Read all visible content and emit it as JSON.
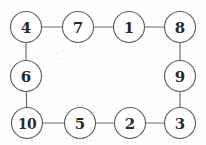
{
  "figure": {
    "kind": "graph-diagram",
    "background_color": "#fefefe",
    "node_fill": "#ffffff",
    "node_stroke": "#5f5f5f",
    "edge_stroke": "#6b6b6b",
    "label_color": "#2a2a2a",
    "node_radius": 15.5,
    "width": 206,
    "height": 145
  },
  "chart_data": {
    "type": "graph",
    "title": "",
    "xlabel": "",
    "ylabel": "",
    "directed": false,
    "node_count": 10,
    "edge_count": 10,
    "nodes": [
      {
        "id": "4",
        "label": "4",
        "x": 26,
        "y": 27,
        "position": "top-left"
      },
      {
        "id": "7",
        "label": "7",
        "x": 78,
        "y": 27,
        "position": "top"
      },
      {
        "id": "1",
        "label": "1",
        "x": 129,
        "y": 27,
        "position": "top"
      },
      {
        "id": "8",
        "label": "8",
        "x": 180,
        "y": 27,
        "position": "top-right"
      },
      {
        "id": "9",
        "label": "9",
        "x": 180,
        "y": 76,
        "position": "right"
      },
      {
        "id": "3",
        "label": "3",
        "x": 180,
        "y": 123,
        "position": "bottom-right"
      },
      {
        "id": "2",
        "label": "2",
        "x": 130,
        "y": 123,
        "position": "bottom"
      },
      {
        "id": "5",
        "label": "5",
        "x": 80,
        "y": 123,
        "position": "bottom"
      },
      {
        "id": "10",
        "label": "10",
        "x": 27,
        "y": 123,
        "position": "bottom-left"
      },
      {
        "id": "6",
        "label": "6",
        "x": 26,
        "y": 76,
        "position": "left"
      }
    ],
    "edges": [
      {
        "source": "4",
        "target": "7"
      },
      {
        "source": "7",
        "target": "1"
      },
      {
        "source": "1",
        "target": "8"
      },
      {
        "source": "8",
        "target": "9"
      },
      {
        "source": "9",
        "target": "3"
      },
      {
        "source": "3",
        "target": "2"
      },
      {
        "source": "2",
        "target": "5"
      },
      {
        "source": "5",
        "target": "10"
      },
      {
        "source": "10",
        "target": "6"
      },
      {
        "source": "6",
        "target": "4"
      }
    ],
    "cycle_order": [
      "4",
      "7",
      "1",
      "8",
      "9",
      "3",
      "2",
      "5",
      "10",
      "6"
    ]
  }
}
